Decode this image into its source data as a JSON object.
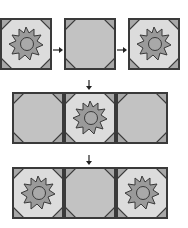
{
  "colors": {
    "border": "#3a3a3a",
    "corner": "#a8a8a8",
    "octagon_plain": "#c2c2c2",
    "octagon_light": "#dcdcdc",
    "flower": "#9a9a9a",
    "center": "#a9a9a9"
  },
  "steps": [
    {
      "row": 1,
      "tiles": [
        {
          "id": "flower-tile",
          "type": "flower"
        },
        {
          "id": "plain-tile",
          "type": "plain"
        },
        {
          "id": "flower-tile",
          "type": "flower"
        }
      ],
      "connectors": [
        "right-arrow",
        "right-arrow"
      ]
    },
    {
      "row": 2,
      "tiles": [
        {
          "type": "plain"
        },
        {
          "type": "flower"
        },
        {
          "type": "plain"
        }
      ]
    },
    {
      "row": 3,
      "tiles": [
        {
          "type": "flower"
        },
        {
          "type": "plain"
        },
        {
          "type": "flower"
        }
      ]
    }
  ],
  "down_arrows": 2
}
